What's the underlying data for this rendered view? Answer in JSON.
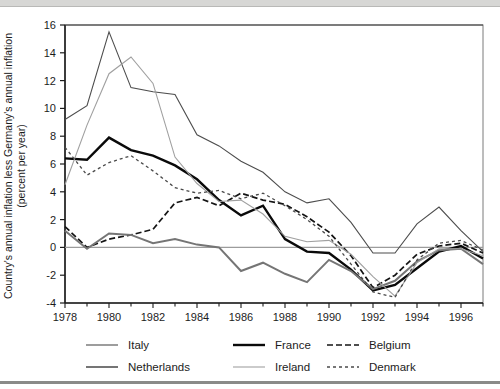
{
  "figure": {
    "y_axis_title_line1": "Country's annual inflation less Germany's annual inflation",
    "y_axis_title_line2": "(percent per year)"
  },
  "chart_data": {
    "type": "line",
    "title": "",
    "xlabel": "",
    "ylabel": "Country's annual inflation less Germany's annual inflation (percent per year)",
    "x": [
      1978,
      1979,
      1980,
      1981,
      1982,
      1983,
      1984,
      1985,
      1986,
      1987,
      1988,
      1989,
      1990,
      1991,
      1992,
      1993,
      1994,
      1995,
      1996,
      1997
    ],
    "x_tick_labels": [
      "1978",
      "1980",
      "1982",
      "1984",
      "1986",
      "1988",
      "1990",
      "1992",
      "1994",
      "1996"
    ],
    "x_labeled_years": [
      1978,
      1980,
      1982,
      1984,
      1986,
      1988,
      1990,
      1992,
      1994,
      1996
    ],
    "xlim": [
      1978,
      1997
    ],
    "ylim": [
      -4,
      16
    ],
    "y_ticks": [
      -4,
      -2,
      0,
      2,
      4,
      6,
      8,
      10,
      12,
      14,
      16
    ],
    "grid": false,
    "zero_line": true,
    "legend_position": "bottom",
    "series": [
      {
        "name": "Italy",
        "style": "solid",
        "color": "#4d4d4d",
        "width": 1.1,
        "dash": "",
        "values": [
          9.2,
          10.2,
          15.5,
          11.5,
          11.2,
          11.0,
          8.1,
          7.3,
          6.2,
          5.4,
          4.0,
          3.2,
          3.5,
          1.8,
          -0.4,
          -0.4,
          1.7,
          2.9,
          1.2,
          -0.3
        ]
      },
      {
        "name": "France",
        "style": "solid",
        "color": "#0a0a0a",
        "width": 2.4,
        "dash": "",
        "values": [
          6.4,
          6.3,
          7.9,
          7.0,
          6.6,
          5.9,
          4.9,
          3.4,
          2.3,
          3.0,
          0.6,
          -0.3,
          -0.4,
          -1.6,
          -3.1,
          -2.7,
          -1.5,
          -0.3,
          0.1,
          -0.8
        ]
      },
      {
        "name": "Belgium",
        "style": "dashed",
        "color": "#141414",
        "width": 1.7,
        "dash": "6,3",
        "values": [
          1.5,
          0.0,
          0.6,
          0.9,
          1.3,
          3.2,
          3.6,
          3.0,
          3.9,
          3.4,
          3.1,
          2.2,
          1.1,
          -0.6,
          -2.9,
          -2.0,
          -0.5,
          0.1,
          0.3,
          -0.4
        ]
      },
      {
        "name": "Netherlands",
        "style": "solid",
        "color": "#757575",
        "width": 2.0,
        "dash": "",
        "values": [
          1.2,
          -0.1,
          1.0,
          0.9,
          0.3,
          0.6,
          0.2,
          0.0,
          -1.7,
          -1.1,
          -1.9,
          -2.5,
          -0.9,
          -1.7,
          -3.0,
          -2.4,
          -1.0,
          -0.2,
          -0.1,
          -1.2
        ]
      },
      {
        "name": "Ireland",
        "style": "solid",
        "color": "#a0a0a0",
        "width": 1.1,
        "dash": "",
        "values": [
          4.5,
          8.8,
          12.5,
          13.7,
          11.8,
          6.5,
          4.6,
          3.3,
          3.4,
          2.4,
          0.8,
          0.4,
          0.5,
          -0.5,
          -2.1,
          -3.5,
          -1.1,
          -0.1,
          -0.1,
          -0.6
        ]
      },
      {
        "name": "Denmark",
        "style": "dashed",
        "color": "#4a4a4a",
        "width": 1.3,
        "dash": "3,3",
        "values": [
          7.2,
          5.2,
          6.1,
          6.6,
          5.5,
          4.3,
          3.9,
          4.1,
          3.5,
          3.9,
          3.0,
          2.0,
          0.8,
          -1.2,
          -3.2,
          -3.6,
          -0.9,
          0.3,
          0.5,
          -0.2
        ]
      }
    ],
    "legend_columns": [
      [
        "Italy",
        "Netherlands"
      ],
      [
        "France",
        "Ireland"
      ],
      [
        "Belgium",
        "Denmark"
      ]
    ]
  }
}
